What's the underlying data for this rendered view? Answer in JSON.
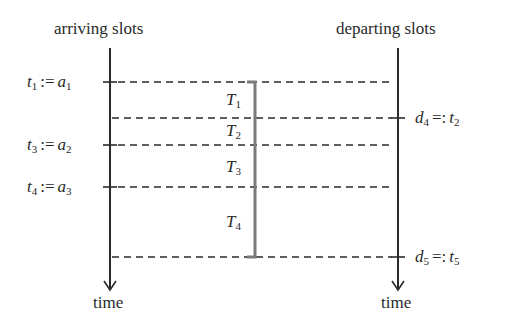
{
  "diagram": {
    "left_axis": {
      "title": "arriving slots",
      "bottom_label": "time"
    },
    "right_axis": {
      "title": "departing slots",
      "bottom_label": "time"
    },
    "left_labels": [
      {
        "var": "t",
        "var_sub": "1",
        "op": ":=",
        "rhs": "a",
        "rhs_sub": "1"
      },
      {
        "var": "t",
        "var_sub": "3",
        "op": ":=",
        "rhs": "a",
        "rhs_sub": "2"
      },
      {
        "var": "t",
        "var_sub": "4",
        "op": ":=",
        "rhs": "a",
        "rhs_sub": "3"
      }
    ],
    "right_labels": [
      {
        "lhs": "d",
        "lhs_sub": "4",
        "op": "=:",
        "var": "t",
        "var_sub": "2"
      },
      {
        "lhs": "d",
        "lhs_sub": "5",
        "op": "=:",
        "var": "t",
        "var_sub": "5"
      }
    ],
    "intervals": [
      {
        "name": "T",
        "sub": "1"
      },
      {
        "name": "T",
        "sub": "2"
      },
      {
        "name": "T",
        "sub": "3"
      },
      {
        "name": "T",
        "sub": "4"
      }
    ],
    "colors": {
      "ink": "#2a2a2a",
      "bracket": "#7a7a7a"
    }
  }
}
